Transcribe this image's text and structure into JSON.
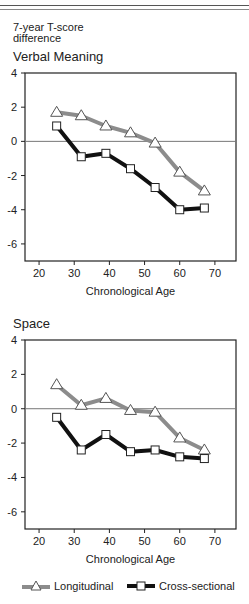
{
  "figure": {
    "y_axis_title": [
      "7-year T-score",
      "difference"
    ],
    "x_axis_title": "Chronological Age",
    "colors": {
      "longitudinal": "#8c8c8c",
      "cross_sectional": "#111111",
      "frame": "#222222",
      "zero_line": "#777777"
    }
  },
  "legend": {
    "items": [
      {
        "label": "Longitudinal",
        "marker": "triangle-icon",
        "color": "#8c8c8c"
      },
      {
        "label": "Cross-sectional",
        "marker": "square-icon",
        "color": "#111111"
      }
    ]
  },
  "chart_data": [
    {
      "type": "line",
      "title": "Verbal Meaning",
      "xlabel": "Chronological Age",
      "ylabel": "7-year T-score difference",
      "x": [
        25,
        32,
        39,
        46,
        53,
        60,
        67
      ],
      "xticks": [
        20,
        30,
        40,
        50,
        60,
        70
      ],
      "yticks": [
        4,
        2,
        0,
        -2,
        -4,
        -6
      ],
      "ytick_labels": [
        "4",
        "2",
        "0",
        "-2",
        "-4",
        "-6"
      ],
      "xlim": [
        16,
        76
      ],
      "ylim": [
        -7,
        4
      ],
      "grid": false,
      "reference_line": 0,
      "legend_position": "bottom",
      "series": [
        {
          "name": "Longitudinal",
          "marker": "triangle",
          "values": [
            1.7,
            1.5,
            0.9,
            0.5,
            -0.1,
            -1.8,
            -2.9
          ]
        },
        {
          "name": "Cross-sectional",
          "marker": "square",
          "values": [
            0.9,
            -0.9,
            -0.7,
            -1.6,
            -2.7,
            -4.0,
            -3.9
          ]
        }
      ]
    },
    {
      "type": "line",
      "title": "Space",
      "xlabel": "Chronological Age",
      "ylabel": "7-year T-score difference",
      "x": [
        25,
        32,
        39,
        46,
        53,
        60,
        67
      ],
      "xticks": [
        20,
        30,
        40,
        50,
        60,
        70
      ],
      "yticks": [
        4,
        2,
        0,
        -2,
        -4,
        -6
      ],
      "ytick_labels": [
        "4",
        "2",
        "0",
        "-2",
        "-4",
        "-6"
      ],
      "xlim": [
        16,
        76
      ],
      "ylim": [
        -7,
        4
      ],
      "grid": false,
      "reference_line": 0,
      "legend_position": "bottom",
      "series": [
        {
          "name": "Longitudinal",
          "marker": "triangle",
          "values": [
            1.4,
            0.2,
            0.6,
            -0.1,
            -0.2,
            -1.7,
            -2.4
          ]
        },
        {
          "name": "Cross-sectional",
          "marker": "square",
          "values": [
            -0.5,
            -2.4,
            -1.5,
            -2.5,
            -2.4,
            -2.8,
            -2.9
          ]
        }
      ]
    }
  ]
}
